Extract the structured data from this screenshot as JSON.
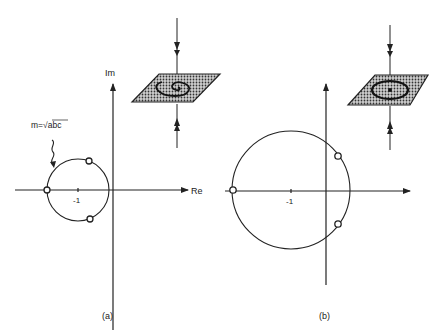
{
  "panels": [
    {
      "id": "a",
      "caption": "(a)",
      "axes": {
        "x_label": "Re",
        "y_label": "Im"
      },
      "tick_label": "-1",
      "annotation": "m=√abc",
      "circle": {
        "center": -1,
        "description": "small circle through open-circle roots"
      },
      "roots": 3
    },
    {
      "id": "b",
      "caption": "(b)",
      "axes": {
        "x_label": "",
        "y_label": ""
      },
      "tick_label": "-1",
      "circle": {
        "center": -1,
        "description": "large circle crossing imaginary axis"
      },
      "roots": 3
    }
  ],
  "insets": [
    {
      "id": "a-inset",
      "description": "shaded plane with inward spiral, arrows pointing toward plane"
    },
    {
      "id": "b-inset",
      "description": "shaded plane with closed orbit, arrows pointing toward plane"
    }
  ],
  "colors": {
    "ink": "#222222",
    "shade": "#888888",
    "background": "#ffffff"
  }
}
